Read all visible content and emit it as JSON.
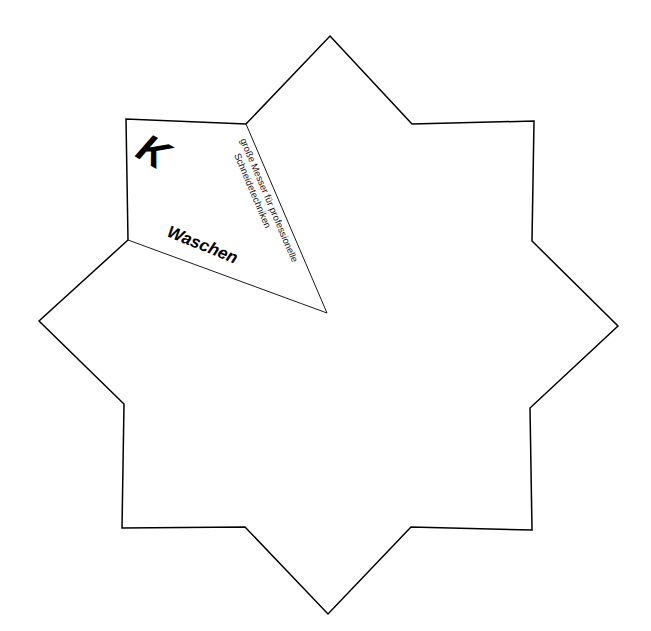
{
  "diagram": {
    "shape": "eight-pointed star",
    "stroke_color": "#000000",
    "fill_color": "#ffffff",
    "segment": {
      "letter": "K",
      "title": "Waschen",
      "description_line1": "große Messer für professionelle",
      "description_line2": "Schneidetechniken"
    }
  }
}
